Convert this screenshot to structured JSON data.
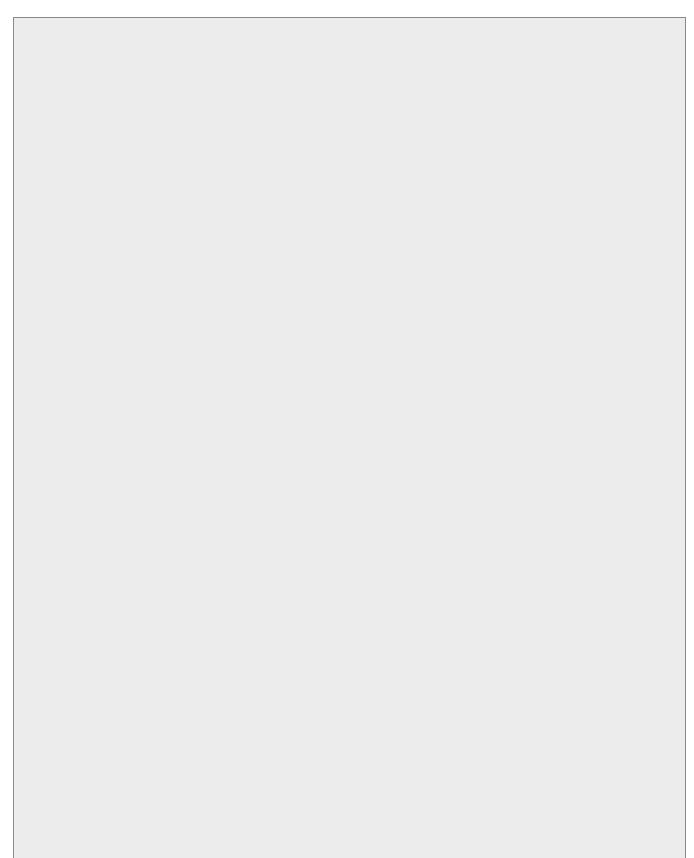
{
  "diagram": {
    "root": "Diagram of ASD with disruptive or\ninterfering co-morbid behaviors or\nsymptoms unresponsive to\nnonpharmacologic interventions",
    "targets": [
      "Targeted\nbehaviors of\nirritability/\naggression",
      "Targeted\nsymptoms of\nattention-deficit\nor hyperactivity",
      "Targeted\nsymptoms of\nstereotyped or\nrepetitive\nbehaviors",
      "Targeted\nco-morbid\nsymptoms of\nanxiety or\ndepression",
      "Targeted\nsymptom of self-\ninjurious behavior"
    ],
    "first_line": [
      "Risperidone\nor\nAripiprazole",
      "Risperidone\nor\nAripiprazole\nor\nMethylphenidate",
      "Risperidone\nor\nAripiprazole",
      "SSRI\nAntidepressant\n\n*FDA-approved\nfor use in children",
      "Risperidone\nor\nAripiprazole"
    ],
    "response_bar_1": "Inadequate/intolerable response",
    "second_line": [
      "Switch to other\nfirst-line\ntreatment\n(Ris to Ari)\nor\n(Ari to Ris)",
      "Atomoxetine\nor\nClonidine\nor\nGuanfacine",
      "Fluoxetine",
      "Alternative SSRI or\nTricyclic\nAntidepressant",
      "Fluoxetine\nor\nNaltrexone"
    ],
    "response_bar_2": "Inadequate/intolerable response",
    "third_line": [
      "FGA: Haloperidol\nSGA: Olanzapine\nor\nDivalproex\nor\nClonidine\nor\nGuanfacine",
      "Naltrexone\nor\nHaloperidol\nor\nDivalproex",
      "Naltrexone\nor\nFluoxetine"
    ]
  },
  "caption": {
    "label": "Figure 1.",
    "title": " Pharmacologic treatment algorithm for autism spectrum disorder.",
    "abbreviations": "Ari = Aripiprazole; ASD = autism spectrum disorder; FDA = U.S. Food and Drug Administration; FGA = first-generation antipsychotic; Ris = Risperidone; SGA = second-generation antipsychotic; SSRI = selective serotonin reuptake inhibitor."
  },
  "colors": {
    "box_fill": "#c9c9c9",
    "frame_bg": "#ececec",
    "connector": "#111111",
    "bar_fill": "#ffffff"
  }
}
